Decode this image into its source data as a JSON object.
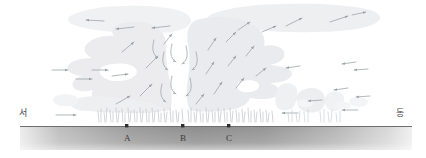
{
  "figure": {
    "type": "meteorological-cross-section",
    "direction_labels": {
      "left": "서",
      "right": "동"
    },
    "ground_points": [
      {
        "id": "A",
        "label": "A",
        "x": 127,
        "marker": "dot"
      },
      {
        "id": "B",
        "label": "B",
        "x": 183,
        "marker": "dot"
      },
      {
        "id": "C",
        "label": "C",
        "x": 229,
        "marker": "dot"
      }
    ],
    "colors": {
      "cloud_fill": "#eceef0",
      "cloud_fill_light": "#f3f4f6",
      "arrow": "#9aa0a6",
      "ground_dark": "#8d8d8d",
      "ground_light": "#e6e6e6",
      "ground_top_line": "#6e6e6e",
      "precipitation": "#b9bdc2",
      "text": "#4a4a4a"
    },
    "ground": {
      "x_start": 20,
      "x_end": 412,
      "y_top": 126,
      "y_bottom": 150
    },
    "precipitation_bands": [
      {
        "x_start": 96,
        "x_end": 182,
        "label": "heavy-shaft-west"
      },
      {
        "x_start": 186,
        "x_end": 274,
        "label": "heavy-shaft-east"
      },
      {
        "x_start": 286,
        "x_end": 310,
        "label": "light-shaft-1"
      },
      {
        "x_start": 318,
        "x_end": 340,
        "label": "light-shaft-2"
      }
    ],
    "arrow_groups": [
      {
        "name": "anvil-outflow-upper",
        "direction": "divergent-horizontal"
      },
      {
        "name": "updraft-core",
        "direction": "upward"
      },
      {
        "name": "downdraft-center",
        "direction": "downward-curved"
      },
      {
        "name": "low-level-inflow-west",
        "direction": "eastward"
      },
      {
        "name": "low-level-inflow-east",
        "direction": "westward"
      }
    ]
  }
}
